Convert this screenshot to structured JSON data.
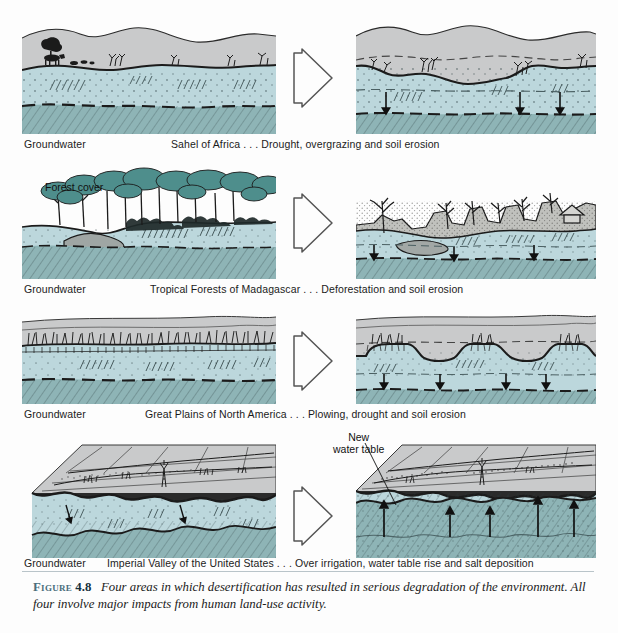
{
  "figure": {
    "number_label": "Figure",
    "number": "4.8",
    "caption": "Four areas in which desertification has resulted in serious degradation of the environment. All four involve major impacts from human land-use activity."
  },
  "colors": {
    "sky_gray": "#c9cacb",
    "unsaturated_blue": "#bcd7dc",
    "saturated_blue": "#8eb4b6",
    "vegetation_teal": "#4e8e8c",
    "ink": "#1b1b1b",
    "caption_accent": "#4a6d7c"
  },
  "rows": [
    {
      "id": "sahel",
      "groundwater_label": "Groundwater",
      "caption": "Sahel of Africa . . . Drought, overgrazing and soil erosion",
      "before": {
        "name": "before-panel",
        "description": "Rolling hills with cattle, shrubs and trees; water table high beneath surface"
      },
      "after": {
        "name": "after-panel",
        "description": "Eroded, gullied land with sparse shrubs; water table dropped, downward arrows",
        "arrow_direction": "down",
        "arrow_count": 3
      },
      "transition_arrow": "right-arrow-outline"
    },
    {
      "id": "madagascar",
      "groundwater_label": "Groundwater",
      "caption": "Tropical Forests of Madagascar . . . Deforestation and soil erosion",
      "inline_label": "Forest cover",
      "before": {
        "name": "before-panel",
        "description": "Dense tropical forest canopy over stream; high water table"
      },
      "after": {
        "name": "after-panel",
        "description": "Deforested, deeply gullied slopes with dead trees and a hut; water table dropped, downward arrows",
        "arrow_direction": "down",
        "arrow_count": 3
      },
      "transition_arrow": "right-arrow-outline"
    },
    {
      "id": "great-plains",
      "groundwater_label": "Groundwater",
      "caption": "Great Plains of North America . . . Plowing, drought and soil erosion",
      "before": {
        "name": "before-panel",
        "description": "Continuous grass prairie sod over flat plain; water table high"
      },
      "after": {
        "name": "after-panel",
        "description": "Grass remnants on eroded pedestals, blown-out soil; water table dropped, downward arrows",
        "arrow_direction": "down",
        "arrow_count": 4
      },
      "transition_arrow": "right-arrow-outline"
    },
    {
      "id": "imperial-valley",
      "groundwater_label": "Groundwater",
      "caption": "Imperial Valley of the United States . . . Over irrigation, water table rise and salt deposition",
      "callout": {
        "line1": "New",
        "line2": "water table",
        "leader": "line to water table in after panel"
      },
      "before": {
        "name": "before-panel",
        "description": "Block diagram of irrigated fields; undulating water table deep below surface"
      },
      "after": {
        "name": "after-panel",
        "description": "Block diagram with water table risen near surface, salt deposition; upward arrows",
        "arrow_direction": "up",
        "arrow_count": 5
      },
      "transition_arrow": "right-arrow-outline"
    }
  ]
}
